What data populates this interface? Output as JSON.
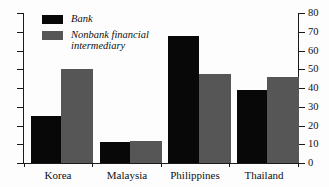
{
  "chart_data": {
    "type": "bar",
    "title": "",
    "xlabel": "",
    "ylabel": "",
    "categories": [
      "Korea",
      "Malaysia",
      "Philippines",
      "Thailand"
    ],
    "series": [
      {
        "name": "Bank",
        "color": "#080808",
        "values": [
          25,
          11,
          68,
          39
        ]
      },
      {
        "name": "Nonbank financial intermediary",
        "color": "#565656",
        "values": [
          50,
          11.5,
          47.5,
          46
        ]
      }
    ],
    "ylim": [
      0,
      80
    ],
    "yticks": [
      0,
      10,
      20,
      30,
      40,
      50,
      60,
      70,
      80
    ],
    "ytick_labels": [
      "0",
      "10",
      "20",
      "30",
      "40",
      "50",
      "60",
      "70",
      "80"
    ],
    "grid": false,
    "legend_position": "top-left",
    "legend": [
      {
        "label": "Bank",
        "swatch": "#080808"
      },
      {
        "label": "Nonbank financial intermediary",
        "swatch": "#565656"
      }
    ]
  },
  "legend": {
    "bank_label": "Bank",
    "nonbank_label_line1": "Nonbank financial",
    "nonbank_label_line2": "intermediary"
  },
  "axis": {
    "t0": "0",
    "t10": "10",
    "t20": "20",
    "t30": "30",
    "t40": "40",
    "t50": "50",
    "t60": "60",
    "t70": "70",
    "t80": "80"
  },
  "categories": {
    "c0": "Korea",
    "c1": "Malaysia",
    "c2": "Philippines",
    "c3": "Thailand"
  },
  "colors": {
    "bank": "#080808",
    "nonbank": "#565656",
    "axis": "#1a1a1a",
    "background": "#fdfdfd"
  }
}
